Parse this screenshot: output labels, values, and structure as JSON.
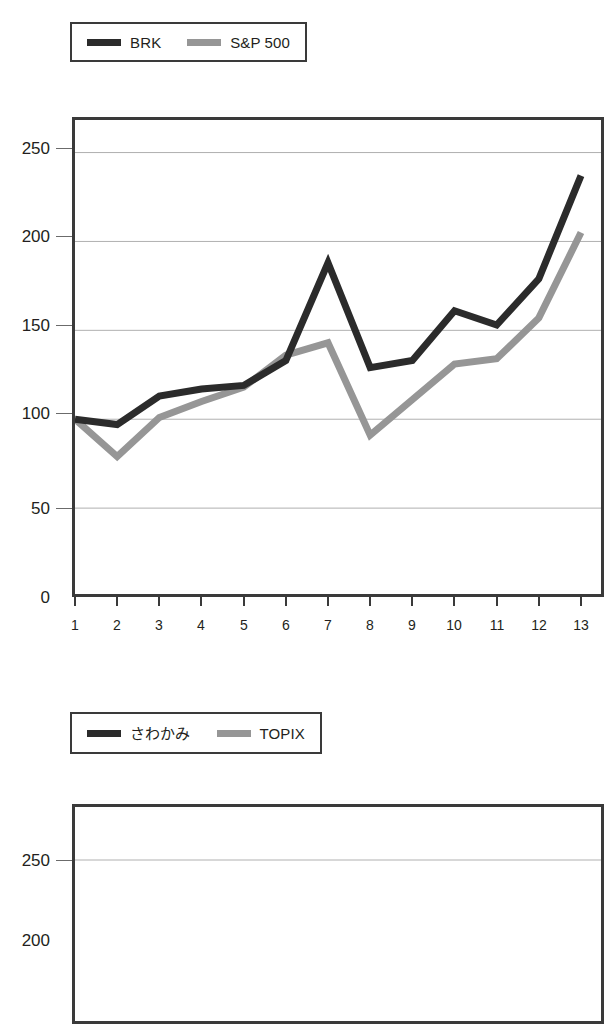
{
  "page": {
    "width": 614,
    "height": 947,
    "background": "#ffffff"
  },
  "colors": {
    "series_dark": "#2b2b2b",
    "series_gray": "#969696",
    "axis": "#3a3a3a",
    "gridline": "#b0b0b0",
    "text": "#231f20"
  },
  "charts": [
    {
      "id": "chart-brk-sp500",
      "legend": {
        "entries": [
          {
            "label": "BRK",
            "color": "#2b2b2b"
          },
          {
            "label": "S&P 500",
            "color": "#969696"
          }
        ]
      },
      "chart_data": {
        "type": "line",
        "title": "",
        "xlabel": "",
        "ylabel": "",
        "categories": [
          "1",
          "2",
          "3",
          "4",
          "5",
          "6",
          "7",
          "8",
          "9",
          "10",
          "11",
          "12",
          "13"
        ],
        "x": [
          1,
          2,
          3,
          4,
          5,
          6,
          7,
          8,
          9,
          10,
          11,
          12,
          13
        ],
        "ylim": [
          0,
          270
        ],
        "yticks": [
          0,
          50,
          100,
          150,
          200,
          250
        ],
        "ytick_labels": [
          "0",
          "50",
          "100",
          "150",
          "200",
          "250"
        ],
        "grid": true,
        "legend_position": "above-plot",
        "series": [
          {
            "name": "BRK",
            "color": "#2b2b2b",
            "values": [
              100,
              97,
              113,
              117,
              119,
              133,
              188,
              129,
              133,
              161,
              153,
              179,
              237
            ]
          },
          {
            "name": "S&P 500",
            "color": "#969696",
            "values": [
              100,
              79,
              101,
              110,
              118,
              136,
              143,
              91,
              111,
              131,
              134,
              157,
              205
            ]
          }
        ]
      }
    },
    {
      "id": "chart-sawakami-topix",
      "legend": {
        "entries": [
          {
            "label": "さわかみ",
            "color": "#2b2b2b"
          },
          {
            "label": "TOPIX",
            "color": "#969696"
          }
        ]
      },
      "chart_data": {
        "type": "line",
        "title": "",
        "xlabel": "",
        "ylabel": "",
        "ylim": [
          0,
          270
        ],
        "yticks": [
          250,
          200
        ],
        "ytick_labels": [
          "250",
          "200"
        ],
        "grid": true,
        "legend_position": "above-plot",
        "note_clipped": "chart is cut off at the bottom edge of the screenshot",
        "series": [
          {
            "name": "さわかみ",
            "color": "#2b2b2b",
            "values": []
          },
          {
            "name": "TOPIX",
            "color": "#969696",
            "values": []
          }
        ]
      }
    }
  ]
}
